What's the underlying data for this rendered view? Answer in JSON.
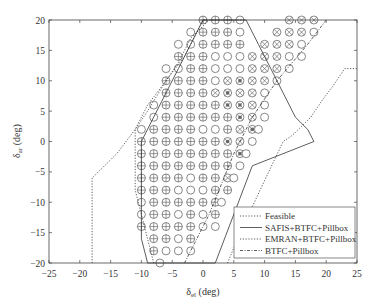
{
  "chart_data": {
    "type": "line",
    "title": "",
    "xlabel": "δel (deg)",
    "ylabel": "δar (deg)",
    "xlim": [
      -25,
      25
    ],
    "ylim": [
      -20,
      20
    ],
    "xticks": [
      -25,
      -20,
      -15,
      -10,
      -5,
      0,
      5,
      10,
      15,
      20,
      25
    ],
    "yticks": [
      -20,
      -15,
      -10,
      -5,
      0,
      5,
      10,
      15,
      20
    ],
    "grid": false,
    "legend_position": "lower right",
    "series": [
      {
        "name": "Feasible",
        "style": "dotted",
        "x": [
          -18,
          -18,
          -14,
          -11,
          -9,
          -6,
          -4,
          -2,
          1,
          4,
          6,
          13,
          14.5,
          17.5,
          19.5,
          21,
          23,
          25
        ],
        "y": [
          -20,
          -6,
          -2,
          2,
          5,
          10,
          13,
          17,
          20,
          -20,
          -15,
          0,
          1,
          4,
          7,
          9,
          12,
          12
        ]
      },
      {
        "name": "SAFIS+BTFC+Pillbox",
        "style": "solid",
        "x": [
          -9,
          -10,
          -10,
          -10,
          -8,
          -6,
          -4,
          -2,
          0,
          7,
          7,
          9,
          11,
          13,
          15,
          17,
          18,
          8,
          2,
          -1,
          -5,
          -7,
          -9
        ],
        "y": [
          -20,
          -16,
          -10,
          0,
          4,
          8,
          12,
          16,
          20,
          20,
          20,
          16,
          12,
          8,
          4,
          2,
          0,
          -4,
          -20,
          -20,
          -20,
          -20,
          -20
        ]
      },
      {
        "name": "EMRAN+BTFC+Pillbox",
        "style": "dotted",
        "x": [
          -8,
          -11,
          -11,
          -9,
          -6,
          -3,
          0,
          7
        ],
        "y": [
          -20,
          -8,
          2,
          6,
          10,
          14,
          20,
          20
        ]
      },
      {
        "name": "BTFC+Pillbox",
        "style": "dash-dot",
        "x": [
          -3,
          1,
          5,
          8,
          12,
          17,
          20
        ],
        "y": [
          -20,
          -12,
          -2,
          4,
          10,
          16,
          20
        ]
      }
    ],
    "marker_grid": {
      "spacing": 2,
      "legend": {
        "circle": "○ open circle",
        "plus": "⊕ circle-plus",
        "cross": "⊗ circle-cross",
        "dot": "⊙ circle-dot"
      },
      "rows": [
        {
          "y": 20,
          "points": [
            [
              0,
              "plus"
            ],
            [
              2,
              "plus"
            ],
            [
              4,
              "plus"
            ],
            [
              6,
              "circle"
            ],
            [
              14,
              "cross"
            ],
            [
              16,
              "cross"
            ],
            [
              18,
              "cross"
            ]
          ]
        },
        {
          "y": 18,
          "points": [
            [
              -2,
              "circle"
            ],
            [
              0,
              "plus"
            ],
            [
              2,
              "plus"
            ],
            [
              4,
              "plus"
            ],
            [
              6,
              "circle"
            ],
            [
              12,
              "cross"
            ],
            [
              14,
              "cross"
            ],
            [
              16,
              "cross"
            ],
            [
              18,
              "circle"
            ]
          ]
        },
        {
          "y": 16,
          "points": [
            [
              -4,
              "circle"
            ],
            [
              -2,
              "circle"
            ],
            [
              0,
              "plus"
            ],
            [
              2,
              "plus"
            ],
            [
              4,
              "plus"
            ],
            [
              6,
              "plus"
            ],
            [
              10,
              "cross"
            ],
            [
              12,
              "cross"
            ],
            [
              14,
              "cross"
            ],
            [
              16,
              "circle"
            ]
          ]
        },
        {
          "y": 14,
          "points": [
            [
              -4,
              "plus"
            ],
            [
              -2,
              "plus"
            ],
            [
              0,
              "plus"
            ],
            [
              2,
              "circle"
            ],
            [
              4,
              "circle"
            ],
            [
              6,
              "circle"
            ],
            [
              8,
              "cross"
            ],
            [
              10,
              "cross"
            ],
            [
              12,
              "cross"
            ],
            [
              14,
              "circle"
            ],
            [
              16,
              "circle"
            ]
          ]
        },
        {
          "y": 12,
          "points": [
            [
              -6,
              "circle"
            ],
            [
              -4,
              "circle"
            ],
            [
              -2,
              "plus"
            ],
            [
              0,
              "plus"
            ],
            [
              2,
              "circle"
            ],
            [
              4,
              "circle"
            ],
            [
              6,
              "circle"
            ],
            [
              8,
              "cross"
            ],
            [
              10,
              "cross"
            ],
            [
              12,
              "cross"
            ],
            [
              14,
              "circle"
            ]
          ]
        },
        {
          "y": 10,
          "points": [
            [
              -6,
              "plus"
            ],
            [
              -4,
              "plus"
            ],
            [
              -2,
              "plus"
            ],
            [
              0,
              "plus"
            ],
            [
              2,
              "circle"
            ],
            [
              4,
              "cross"
            ],
            [
              6,
              "dot"
            ],
            [
              8,
              "cross"
            ],
            [
              10,
              "cross"
            ],
            [
              12,
              "circle"
            ]
          ]
        },
        {
          "y": 8,
          "points": [
            [
              -6,
              "plus"
            ],
            [
              -4,
              "plus"
            ],
            [
              -2,
              "plus"
            ],
            [
              0,
              "plus"
            ],
            [
              2,
              "cross"
            ],
            [
              4,
              "dot"
            ],
            [
              6,
              "cross"
            ],
            [
              8,
              "cross"
            ],
            [
              10,
              "circle"
            ]
          ]
        },
        {
          "y": 6,
          "points": [
            [
              -8,
              "circle"
            ],
            [
              -6,
              "plus"
            ],
            [
              -4,
              "plus"
            ],
            [
              -2,
              "plus"
            ],
            [
              0,
              "plus"
            ],
            [
              2,
              "plus"
            ],
            [
              4,
              "dot"
            ],
            [
              6,
              "dot"
            ],
            [
              8,
              "cross"
            ],
            [
              10,
              "circle"
            ]
          ]
        },
        {
          "y": 4,
          "points": [
            [
              -8,
              "circle"
            ],
            [
              -6,
              "plus"
            ],
            [
              -4,
              "plus"
            ],
            [
              -2,
              "plus"
            ],
            [
              0,
              "plus"
            ],
            [
              2,
              "plus"
            ],
            [
              4,
              "plus"
            ],
            [
              6,
              "dot"
            ],
            [
              8,
              "cross"
            ],
            [
              10,
              "circle"
            ]
          ]
        },
        {
          "y": 2,
          "points": [
            [
              -10,
              "circle"
            ],
            [
              -8,
              "plus"
            ],
            [
              -6,
              "plus"
            ],
            [
              -4,
              "plus"
            ],
            [
              -2,
              "plus"
            ],
            [
              0,
              "circle"
            ],
            [
              2,
              "circle"
            ],
            [
              4,
              "plus"
            ],
            [
              6,
              "cross"
            ],
            [
              8,
              "dot"
            ],
            [
              9,
              "circle"
            ]
          ]
        },
        {
          "y": 0,
          "points": [
            [
              -10,
              "plus"
            ],
            [
              -8,
              "plus"
            ],
            [
              -6,
              "plus"
            ],
            [
              -4,
              "plus"
            ],
            [
              -2,
              "plus"
            ],
            [
              0,
              "plus"
            ],
            [
              2,
              "plus"
            ],
            [
              4,
              "dot"
            ],
            [
              6,
              "cross"
            ],
            [
              8,
              "circle"
            ]
          ]
        },
        {
          "y": -2,
          "points": [
            [
              -10,
              "plus"
            ],
            [
              -8,
              "plus"
            ],
            [
              -6,
              "plus"
            ],
            [
              -4,
              "plus"
            ],
            [
              -2,
              "plus"
            ],
            [
              0,
              "plus"
            ],
            [
              2,
              "plus"
            ],
            [
              4,
              "plus"
            ],
            [
              6,
              "dot"
            ],
            [
              7,
              "circle"
            ]
          ]
        },
        {
          "y": -4,
          "points": [
            [
              -10,
              "plus"
            ],
            [
              -8,
              "plus"
            ],
            [
              -6,
              "plus"
            ],
            [
              -4,
              "plus"
            ],
            [
              -2,
              "plus"
            ],
            [
              0,
              "plus"
            ],
            [
              2,
              "plus"
            ],
            [
              4,
              "plus"
            ],
            [
              6,
              "circle"
            ]
          ]
        },
        {
          "y": -6,
          "points": [
            [
              -10,
              "plus"
            ],
            [
              -8,
              "plus"
            ],
            [
              -6,
              "plus"
            ],
            [
              -4,
              "plus"
            ],
            [
              -2,
              "circle"
            ],
            [
              0,
              "plus"
            ],
            [
              2,
              "plus"
            ],
            [
              4,
              "cross"
            ],
            [
              5,
              "circle"
            ]
          ]
        },
        {
          "y": -8,
          "points": [
            [
              -10,
              "plus"
            ],
            [
              -8,
              "plus"
            ],
            [
              -6,
              "plus"
            ],
            [
              -4,
              "circle"
            ],
            [
              -2,
              "circle"
            ],
            [
              0,
              "circle"
            ],
            [
              2,
              "plus"
            ],
            [
              4,
              "plus"
            ]
          ]
        },
        {
          "y": -10,
          "points": [
            [
              -10,
              "circle"
            ],
            [
              -8,
              "plus"
            ],
            [
              -6,
              "plus"
            ],
            [
              -4,
              "plus"
            ],
            [
              -2,
              "plus"
            ],
            [
              0,
              "plus"
            ],
            [
              2,
              "plus"
            ],
            [
              3,
              "circle"
            ]
          ]
        },
        {
          "y": -12,
          "points": [
            [
              -10,
              "circle"
            ],
            [
              -8,
              "plus"
            ],
            [
              -6,
              "plus"
            ],
            [
              -4,
              "circle"
            ],
            [
              -2,
              "plus"
            ],
            [
              0,
              "circle"
            ],
            [
              2,
              "plus"
            ]
          ]
        },
        {
          "y": -14,
          "points": [
            [
              -10,
              "plus"
            ],
            [
              -8,
              "plus"
            ],
            [
              -6,
              "plus"
            ],
            [
              -4,
              "plus"
            ],
            [
              -2,
              "plus"
            ],
            [
              0,
              "circle"
            ],
            [
              2,
              "circle"
            ]
          ]
        },
        {
          "y": -16,
          "points": [
            [
              -8,
              "plus"
            ],
            [
              -6,
              "plus"
            ],
            [
              -4,
              "circle"
            ],
            [
              -2,
              "plus"
            ]
          ]
        },
        {
          "y": -18,
          "points": [
            [
              -8,
              "plus"
            ],
            [
              -6,
              "circle"
            ],
            [
              -4,
              "circle"
            ],
            [
              -2,
              "circle"
            ]
          ]
        },
        {
          "y": -20,
          "points": [
            [
              -7,
              "circle"
            ]
          ]
        }
      ]
    }
  },
  "axes": {
    "xlabel_main": "δ",
    "xlabel_sub": "el",
    "xlabel_unit": " (deg)",
    "ylabel_main": "δ",
    "ylabel_sub": "ar",
    "ylabel_unit": " (deg)"
  },
  "legend": {
    "items": [
      {
        "label": "Feasible",
        "style": "dotted"
      },
      {
        "label": "SAFIS+BTFC+Pillbox",
        "style": "solid"
      },
      {
        "label": "EMRAN+BTFC+Pillbox",
        "style": "dotted"
      },
      {
        "label": "BTFC+Pillbox",
        "style": "dash-dot"
      }
    ]
  },
  "colors": {
    "line": "#333333",
    "frame": "#444444",
    "marker": "#555555",
    "background": "#ffffff"
  }
}
